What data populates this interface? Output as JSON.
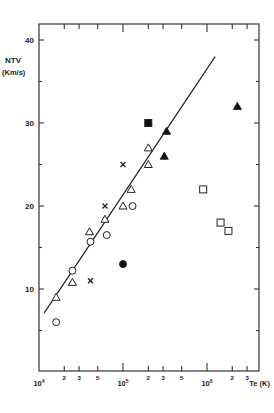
{
  "chart_data": {
    "type": "scatter",
    "title": "",
    "ylabel": "NTV",
    "ylabel_units": "(Km/s)",
    "xlabel": "T_e (K)",
    "xscale": "log",
    "xlim": [
      10000,
      3600000
    ],
    "ylim": [
      0,
      42
    ],
    "y_ticks": [
      10,
      20,
      30,
      40
    ],
    "y_tick_labels": [
      "10",
      "20",
      "30",
      "40"
    ],
    "y_minor_ticks": [
      5,
      15,
      25,
      35
    ],
    "x_major_ticks": [
      10000,
      100000,
      1000000
    ],
    "x_major_labels": [
      "10^4",
      "10^5",
      "10^6"
    ],
    "x_minor_ticks": [
      20000,
      30000,
      50000,
      200000,
      300000,
      500000,
      2000000,
      3000000
    ],
    "x_minor_labels": [
      "2",
      "3",
      "5",
      "2",
      "3",
      "5",
      "2",
      "3"
    ],
    "grid": false,
    "legend": null,
    "series": [
      {
        "name": "open-circle",
        "marker": "circle-open",
        "points": [
          [
            16000,
            6
          ],
          [
            25000,
            12.2
          ],
          [
            41000,
            15.7
          ],
          [
            64000,
            16.5
          ],
          [
            130000,
            20
          ]
        ]
      },
      {
        "name": "open-triangle",
        "marker": "triangle-open",
        "points": [
          [
            16000,
            9
          ],
          [
            25000,
            10.8
          ],
          [
            40000,
            16.9
          ],
          [
            61000,
            18.4
          ],
          [
            100000,
            20
          ],
          [
            125000,
            22
          ],
          [
            200000,
            25
          ],
          [
            200000,
            27
          ]
        ]
      },
      {
        "name": "cross",
        "marker": "x",
        "points": [
          [
            41000,
            11
          ],
          [
            61000,
            20
          ],
          [
            100000,
            25
          ]
        ]
      },
      {
        "name": "filled-circle",
        "marker": "circle-filled",
        "points": [
          [
            100000,
            13
          ]
        ]
      },
      {
        "name": "filled-square",
        "marker": "square-filled",
        "points": [
          [
            200000,
            30
          ]
        ]
      },
      {
        "name": "filled-triangle",
        "marker": "triangle-filled",
        "points": [
          [
            310000,
            26
          ],
          [
            330000,
            29
          ],
          [
            2300000,
            32
          ]
        ]
      },
      {
        "name": "open-square",
        "marker": "square-open",
        "points": [
          [
            900000,
            22
          ],
          [
            1450000,
            18
          ],
          [
            1800000,
            17
          ]
        ]
      }
    ],
    "fit_line": {
      "x": [
        11500,
        1250000
      ],
      "y": [
        7.1,
        38
      ]
    }
  }
}
